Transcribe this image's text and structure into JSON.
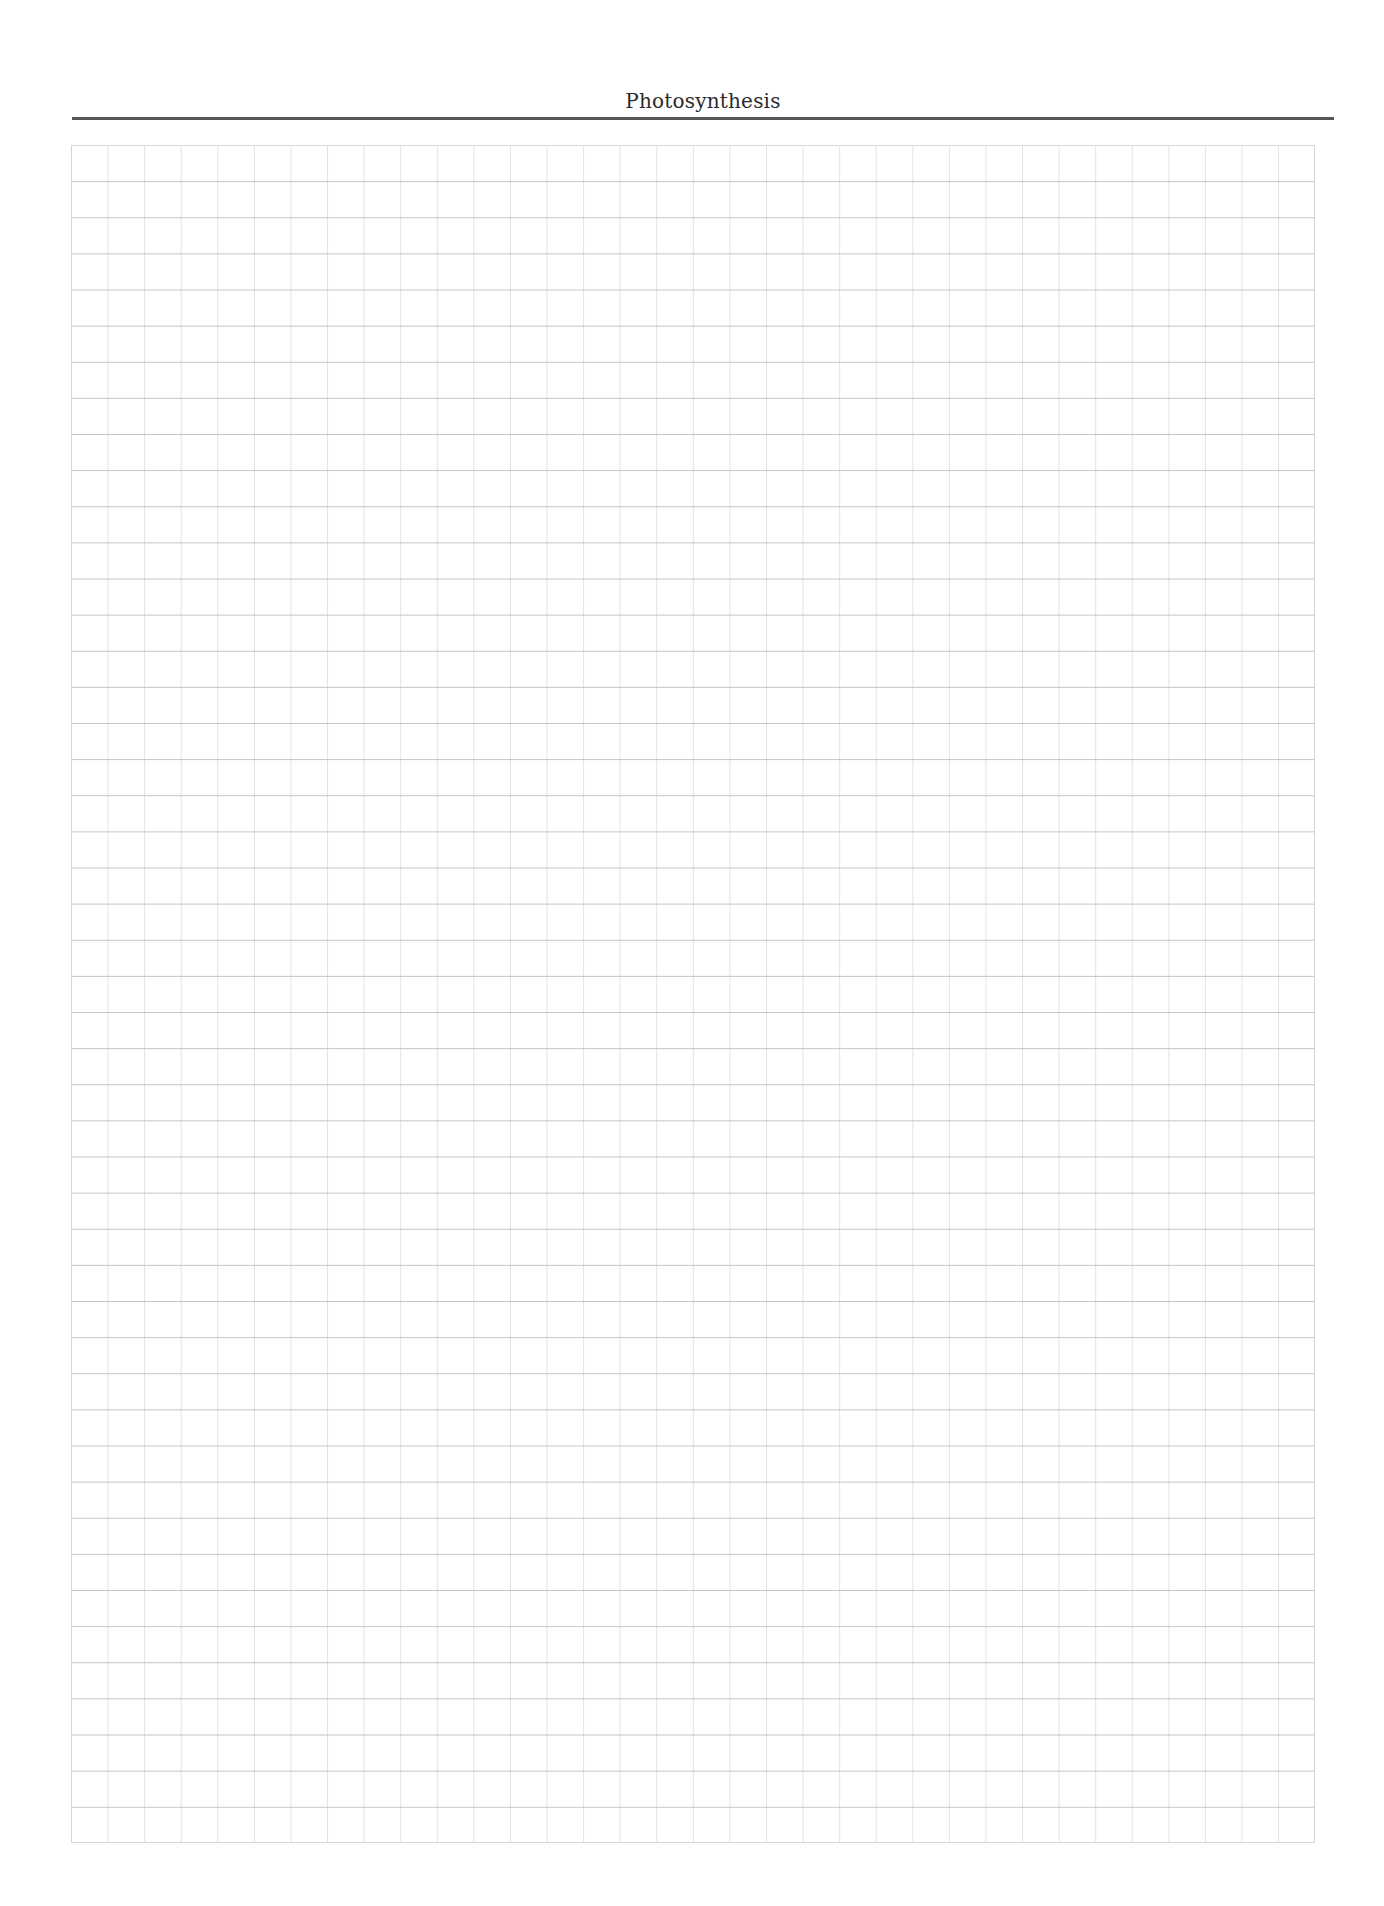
{
  "header": {
    "title": "Photosynthesis"
  },
  "grid": {
    "columns": 34,
    "rows": 47,
    "line_color_horizontal": "#c4c4c4",
    "line_color_vertical": "#e2e2e2"
  },
  "colors": {
    "rule": "#555555",
    "title_text": "#2a2a2a",
    "background": "#ffffff"
  }
}
